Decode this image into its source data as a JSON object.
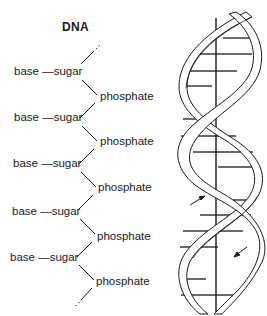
{
  "title": "DNA",
  "backbone": {
    "rows": [
      {
        "base": "base",
        "dash": "—",
        "sugar": "sugar",
        "phosphate": "phosphate"
      },
      {
        "base": "base",
        "dash": "—",
        "sugar": "sugar",
        "phosphate": "phosphate"
      },
      {
        "base": "base",
        "dash": "—",
        "sugar": "sugar",
        "phosphate": "phosphate"
      },
      {
        "base": "base",
        "dash": "—",
        "sugar": "sugar",
        "phosphate": "phosphate"
      },
      {
        "base": "base",
        "dash": "—",
        "sugar": "sugar",
        "phosphate": "phosphate"
      }
    ]
  },
  "helix": {
    "description": "double helix illustration with central axis, base-pair rungs, and strand direction arrows",
    "arrows": [
      "up-left arrow",
      "down-left arrow"
    ]
  },
  "colors": {
    "ink": "#1a1a1a",
    "rung": "#6b6b6b",
    "background": "#ffffff"
  }
}
